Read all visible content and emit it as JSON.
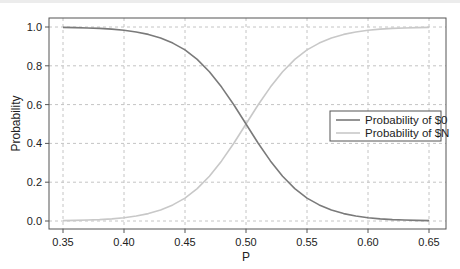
{
  "chart_data": {
    "type": "line",
    "title": "",
    "xlabel": "P",
    "ylabel": "Probability",
    "xlim": [
      0.34,
      0.66
    ],
    "ylim": [
      -0.04,
      1.04
    ],
    "grid": true,
    "legend_position": "center right",
    "x_ticks": [
      "0.35",
      "0.40",
      "0.45",
      "0.50",
      "0.55",
      "0.60",
      "0.65"
    ],
    "y_ticks": [
      "0.0",
      "0.2",
      "0.4",
      "0.6",
      "0.8",
      "1.0"
    ],
    "x": [
      0.35,
      0.36,
      0.37,
      0.38,
      0.39,
      0.4,
      0.41,
      0.42,
      0.43,
      0.44,
      0.45,
      0.46,
      0.47,
      0.48,
      0.49,
      0.5,
      0.51,
      0.52,
      0.53,
      0.54,
      0.55,
      0.56,
      0.57,
      0.58,
      0.59,
      0.6,
      0.61,
      0.62,
      0.63,
      0.64,
      0.65
    ],
    "series": [
      {
        "name": "Probability of $0",
        "color": "#7a7a7a",
        "values": [
          0.998,
          0.997,
          0.995,
          0.993,
          0.989,
          0.983,
          0.974,
          0.962,
          0.944,
          0.917,
          0.882,
          0.833,
          0.769,
          0.69,
          0.599,
          0.5,
          0.401,
          0.31,
          0.231,
          0.167,
          0.118,
          0.083,
          0.056,
          0.038,
          0.026,
          0.017,
          0.011,
          0.007,
          0.005,
          0.003,
          0.002
        ]
      },
      {
        "name": "Probability of $N",
        "color": "#c8c8c8",
        "values": [
          0.002,
          0.003,
          0.005,
          0.007,
          0.011,
          0.017,
          0.026,
          0.038,
          0.056,
          0.083,
          0.118,
          0.167,
          0.231,
          0.31,
          0.401,
          0.5,
          0.599,
          0.69,
          0.769,
          0.833,
          0.882,
          0.917,
          0.944,
          0.962,
          0.974,
          0.983,
          0.989,
          0.993,
          0.995,
          0.997,
          0.998
        ]
      }
    ]
  }
}
